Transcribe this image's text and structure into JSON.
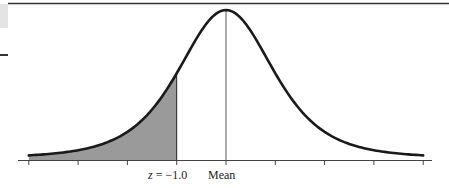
{
  "figure": {
    "labels": {
      "z_var": "z",
      "z_eq": " = −1.0",
      "mean": "Mean"
    },
    "colors": {
      "curve": "#1a1a1a",
      "shade": "#9a9a9a",
      "axis": "#444444",
      "top_rule": "#333333"
    }
  },
  "chart_data": {
    "type": "area",
    "title": "",
    "x_range_sd": [
      -4,
      4
    ],
    "ticks_sd": [
      -4,
      -3,
      -2,
      -1,
      0,
      1,
      2,
      3,
      4
    ],
    "tick_labels": {
      "-1": "z = −1.0",
      "0": "Mean"
    },
    "shaded_region": {
      "from_sd": -4,
      "to_sd": -1.0
    },
    "mean_line": true,
    "xlabel": "",
    "ylabel": "",
    "grid": false
  }
}
